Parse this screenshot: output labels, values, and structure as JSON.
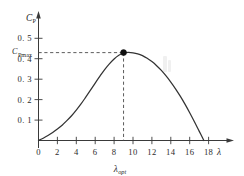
{
  "chart_data": {
    "type": "line",
    "title": "",
    "xlabel": "λ",
    "ylabel": "C_P",
    "xlim": [
      0,
      19.2
    ],
    "ylim": [
      0,
      0.55
    ],
    "grid": false,
    "legend": null,
    "x_ticks": [
      0,
      2,
      4,
      6,
      8,
      10,
      12,
      14,
      16,
      18
    ],
    "x_tick_labels": [
      "0",
      "2",
      "4",
      "6",
      "8",
      "10",
      "12",
      "14",
      "16",
      "18"
    ],
    "y_ticks": [
      0.1,
      0.2,
      0.3,
      0.4,
      0.5
    ],
    "y_tick_labels": [
      "0. 1",
      "0. 2",
      "0. 3",
      "0. 4",
      "0. 5"
    ],
    "series": [
      {
        "name": "Cp curve",
        "color": "#333333",
        "x": [
          0,
          0.5,
          1,
          1.5,
          2,
          2.5,
          3,
          3.5,
          4,
          4.5,
          5,
          5.5,
          6,
          6.5,
          7,
          7.5,
          8,
          8.5,
          9,
          9.5,
          10,
          10.5,
          11,
          11.5,
          12,
          12.5,
          13,
          13.5,
          14,
          14.5,
          15,
          15.5,
          16,
          16.5,
          17,
          17.5
        ],
        "y": [
          0,
          0.011,
          0.024,
          0.039,
          0.056,
          0.075,
          0.097,
          0.121,
          0.149,
          0.179,
          0.212,
          0.246,
          0.281,
          0.315,
          0.347,
          0.375,
          0.399,
          0.417,
          0.428,
          0.431,
          0.429,
          0.424,
          0.415,
          0.402,
          0.386,
          0.366,
          0.343,
          0.316,
          0.286,
          0.253,
          0.217,
          0.178,
          0.136,
          0.092,
          0.046,
          0.0
        ]
      }
    ],
    "annotations": {
      "peak_point": {
        "x": 9,
        "y": 0.43,
        "marker": "filled-circle"
      },
      "cpmax_label": "C",
      "cpmax_sub": "Pmax",
      "cpmax_value": 0.43,
      "lambda_opt_label": "λ",
      "lambda_opt_sub": "opt",
      "lambda_opt_value": 9,
      "guides": [
        "horizontal-dashed-to-peak",
        "vertical-dashed-to-peak"
      ]
    },
    "axes_style": {
      "arrow_heads": true,
      "axis_color": "#3a3a3a",
      "curve_color": "#333333",
      "guide_color": "#4a4a4a",
      "marker_color": "#111111",
      "background": "#ffffff"
    }
  },
  "labels": {
    "y_axis_name": "C",
    "y_axis_sub": "P",
    "x_axis_name": "λ"
  }
}
